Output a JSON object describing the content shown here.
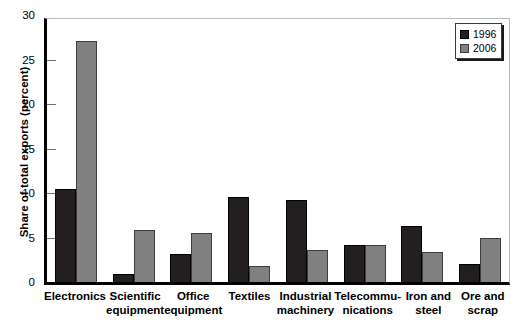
{
  "chart_data": {
    "type": "bar",
    "title": "",
    "xlabel": "",
    "ylabel": "Share of total exports (percent)",
    "ylim": [
      0,
      30
    ],
    "yticks": [
      0,
      5,
      10,
      15,
      20,
      25,
      30
    ],
    "ytick_labels": [
      "0",
      "5",
      "10",
      "15",
      "20",
      "25",
      "30"
    ],
    "grid": false,
    "legend_position": "top-right",
    "categories": [
      "Electronics",
      "Scientific\nequipment",
      "Office\nequipment",
      "Textiles",
      "Industrial\nmachinery",
      "Telecommu-\nnications",
      "Iron and\nsteel",
      "Ore and\nscrap"
    ],
    "series": [
      {
        "name": "1996",
        "color": "#231f20",
        "values": [
          10.4,
          0.9,
          3.1,
          9.6,
          9.2,
          4.2,
          6.3,
          2.0
        ]
      },
      {
        "name": "2006",
        "color": "#808080",
        "values": [
          27.1,
          5.9,
          5.5,
          1.8,
          3.6,
          4.2,
          3.4,
          5.0
        ]
      }
    ]
  },
  "legend": {
    "items": [
      {
        "label": "1996",
        "swatch": "dark-swatch"
      },
      {
        "label": "2006",
        "swatch": "gray-swatch"
      }
    ]
  }
}
